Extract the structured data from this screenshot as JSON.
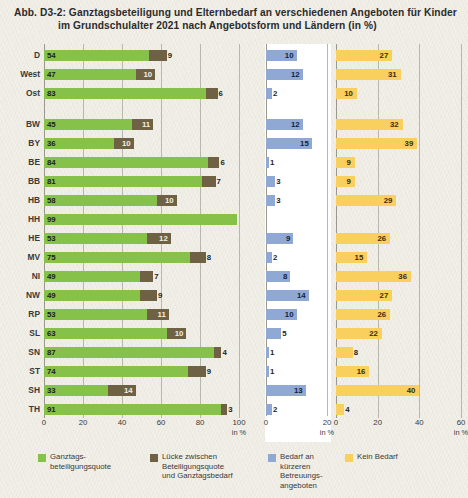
{
  "title": {
    "line1": "Abb. D3-2: Ganztagsbeteiligung und Elternbedarf an verschiedenen Angeboten für Kinder",
    "line2": "im Grundschulalter 2021 nach Angebotsform und Ländern (in %)"
  },
  "legend": [
    {
      "name": "ganztagsbeteiligungsquote",
      "color": "#86c24a",
      "label": "Ganztags-\nbeteiligungsquote"
    },
    {
      "name": "luecke",
      "color": "#6f6244",
      "label": "Lücke zwischen\nBeteiligungsquote\nund Ganztagsbedarf"
    },
    {
      "name": "bedarf-kuerzer",
      "color": "#8fa8d4",
      "label": "Bedarf an\nkürzeren\nBetreuungs-\nangeboten"
    },
    {
      "name": "kein-bedarf",
      "color": "#f9cf5e",
      "label": "Kein Bedarf"
    }
  ],
  "axes": {
    "panelA": {
      "ticks": [
        0,
        20,
        40,
        60,
        80,
        100
      ],
      "unit": "in %",
      "max": 100
    },
    "panelB": {
      "ticks": [
        0,
        20
      ],
      "unit": "in %",
      "max": 20
    },
    "panelC": {
      "ticks": [
        0,
        20,
        40,
        60
      ],
      "unit": "in %",
      "max": 60
    }
  },
  "chart_data": {
    "type": "bar",
    "orientation": "horizontal",
    "title": "Ganztagsbeteiligung und Elternbedarf an verschiedenen Angeboten für Kinder im Grundschulalter 2021 nach Angebotsform und Ländern (in %)",
    "xlabel": "in %",
    "ylabel": "",
    "grid": true,
    "legend_position": "bottom",
    "panels": [
      {
        "name": "panelA",
        "stacked": true,
        "xlim": [
          0,
          100
        ],
        "series": [
          "Ganztagsbeteiligungsquote",
          "Lücke zwischen Beteiligungsquote und Ganztagsbedarf"
        ]
      },
      {
        "name": "panelB",
        "stacked": false,
        "xlim": [
          0,
          20
        ],
        "series": [
          "Bedarf an kürzeren Betreuungsangeboten"
        ]
      },
      {
        "name": "panelC",
        "stacked": false,
        "xlim": [
          0,
          60
        ],
        "series": [
          "Kein Bedarf"
        ]
      }
    ],
    "categories": [
      "D",
      "West",
      "Ost",
      "BW",
      "BY",
      "BE",
      "BB",
      "HB",
      "HH",
      "HE",
      "MV",
      "NI",
      "NW",
      "RP",
      "SL",
      "SN",
      "ST",
      "SH",
      "TH"
    ],
    "rows": [
      {
        "label": "D",
        "group": 0,
        "ganztag": 54,
        "luecke": 9,
        "kuerzer": 10,
        "kein_bedarf": 27
      },
      {
        "label": "West",
        "group": 0,
        "ganztag": 47,
        "luecke": 10,
        "kuerzer": 12,
        "kein_bedarf": 31
      },
      {
        "label": "Ost",
        "group": 0,
        "ganztag": 83,
        "luecke": 6,
        "kuerzer": 2,
        "kein_bedarf": 10
      },
      {
        "label": "BW",
        "group": 1,
        "ganztag": 45,
        "luecke": 11,
        "kuerzer": 12,
        "kein_bedarf": 32
      },
      {
        "label": "BY",
        "group": 1,
        "ganztag": 36,
        "luecke": 10,
        "kuerzer": 15,
        "kein_bedarf": 39
      },
      {
        "label": "BE",
        "group": 1,
        "ganztag": 84,
        "luecke": 6,
        "kuerzer": 1,
        "kein_bedarf": 9
      },
      {
        "label": "BB",
        "group": 1,
        "ganztag": 81,
        "luecke": 7,
        "kuerzer": 3,
        "kein_bedarf": 9
      },
      {
        "label": "HB",
        "group": 1,
        "ganztag": 58,
        "luecke": 10,
        "kuerzer": 3,
        "kein_bedarf": 29
      },
      {
        "label": "HH",
        "group": 1,
        "ganztag": 99,
        "luecke": 0,
        "kuerzer": 0,
        "kein_bedarf": 0
      },
      {
        "label": "HE",
        "group": 1,
        "ganztag": 53,
        "luecke": 12,
        "kuerzer": 9,
        "kein_bedarf": 26
      },
      {
        "label": "MV",
        "group": 1,
        "ganztag": 75,
        "luecke": 8,
        "kuerzer": 2,
        "kein_bedarf": 15
      },
      {
        "label": "NI",
        "group": 1,
        "ganztag": 49,
        "luecke": 7,
        "kuerzer": 8,
        "kein_bedarf": 36
      },
      {
        "label": "NW",
        "group": 1,
        "ganztag": 49,
        "luecke": 9,
        "kuerzer": 14,
        "kein_bedarf": 27
      },
      {
        "label": "RP",
        "group": 1,
        "ganztag": 53,
        "luecke": 11,
        "kuerzer": 10,
        "kein_bedarf": 26
      },
      {
        "label": "SL",
        "group": 1,
        "ganztag": 63,
        "luecke": 10,
        "kuerzer": 5,
        "kein_bedarf": 22
      },
      {
        "label": "SN",
        "group": 1,
        "ganztag": 87,
        "luecke": 4,
        "kuerzer": 1,
        "kein_bedarf": 8
      },
      {
        "label": "ST",
        "group": 1,
        "ganztag": 74,
        "luecke": 9,
        "kuerzer": 1,
        "kein_bedarf": 16
      },
      {
        "label": "SH",
        "group": 1,
        "ganztag": 33,
        "luecke": 14,
        "kuerzer": 13,
        "kein_bedarf": 40
      },
      {
        "label": "TH",
        "group": 1,
        "ganztag": 91,
        "luecke": 3,
        "kuerzer": 2,
        "kein_bedarf": 4
      }
    ]
  }
}
